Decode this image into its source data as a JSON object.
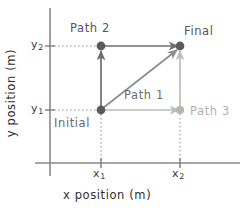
{
  "figure": {
    "kind": "physics-displacement-diagram",
    "axes": {
      "x_title": "x position (m)",
      "y_title": "y position (m)",
      "x_ticks": [
        {
          "id": "x1",
          "base": "x",
          "sub": "1",
          "px": 101
        },
        {
          "id": "x2",
          "base": "x",
          "sub": "2",
          "px": 180
        }
      ],
      "y_ticks": [
        {
          "id": "y2",
          "base": "y",
          "sub": "2",
          "px": 46
        },
        {
          "id": "y1",
          "base": "y",
          "sub": "1",
          "px": 110
        }
      ],
      "grid": "dotted-guides-only",
      "x_axis_y_px": 163,
      "y_axis_x_px": 50
    },
    "points": [
      {
        "name": "Initial",
        "label": "Initial",
        "x": "x1",
        "y": "y1",
        "px": [
          101,
          110
        ],
        "color": "#5a5a5a"
      },
      {
        "name": "Final",
        "label": "Final",
        "x": "x2",
        "y": "y2",
        "px": [
          180,
          46
        ],
        "color": "#5a5a5a"
      },
      {
        "name": "corner-top-left",
        "label": "",
        "x": "x1",
        "y": "y2",
        "px": [
          101,
          46
        ],
        "color": "#5a5a5a"
      },
      {
        "name": "corner-bottom-right",
        "label": "",
        "x": "x2",
        "y": "y1",
        "px": [
          180,
          110
        ],
        "color": "#b4b4b4"
      }
    ],
    "paths": [
      {
        "id": "path1",
        "label": "Path 1",
        "color": "#8c8c8c",
        "route": "diagonal from Initial (x1,y1) direct to Final (x2,y2)",
        "label_px": [
          124,
          88
        ]
      },
      {
        "id": "path2",
        "label": "Path 2",
        "color": "#6e6e6e",
        "route": "up from Initial (x1,y1) to (x1,y2), then right to Final (x2,y2)",
        "label_px": [
          70,
          21
        ]
      },
      {
        "id": "path3",
        "label": "Path 3",
        "color": "#bdbdbd",
        "route": "right from Initial (x1,y1) to (x2,y1), then up to Final (x2,y2)",
        "label_px": [
          190,
          104
        ]
      }
    ],
    "colors": {
      "axis": "#8a8a8a",
      "guide_dotted": "#9a9a9a",
      "path1": "#8c8c8c",
      "path2": "#6e6e6e",
      "path3": "#bdbdbd",
      "dot_dark": "#5a5a5a",
      "dot_light": "#b4b4b4",
      "text_dark": "#2e2e2e",
      "background": "#ffffff"
    }
  }
}
